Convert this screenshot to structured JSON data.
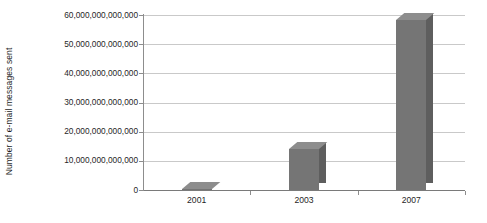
{
  "chart_data": {
    "type": "bar",
    "title": "",
    "xlabel": "",
    "ylabel": "Number of e-mail messages sent",
    "categories": [
      "2001",
      "2003",
      "2007"
    ],
    "values": [
      300000000000,
      14200000000000,
      58200000000000
    ],
    "ylim": [
      0,
      60000000000000
    ],
    "ytick_values": [
      0,
      10000000000000,
      20000000000000,
      30000000000000,
      40000000000000,
      50000000000000,
      60000000000000
    ],
    "ytick_labels": [
      "0",
      "10,000,000,000,000",
      "20,000,000,000,000",
      "30,000,000,000,000",
      "40,000,000,000,000",
      "50,000,000,000,000",
      "60,000,000,000,000"
    ],
    "grid": true,
    "grid_axis": "y",
    "legend": false,
    "legend_position": "none",
    "series": [
      {
        "name": "Number of e-mail messages sent",
        "values": [
          300000000000,
          14200000000000,
          58200000000000
        ]
      }
    ]
  },
  "style": {
    "bar_face_color": "#757575",
    "bar_top_color": "#8d8d8d",
    "bar_side_color": "#5e5e5e",
    "grid_color": "#c9c9c9",
    "axis_color": "#8d8d8d",
    "background_color": "#ffffff",
    "text_color": "#1f1f1f"
  }
}
